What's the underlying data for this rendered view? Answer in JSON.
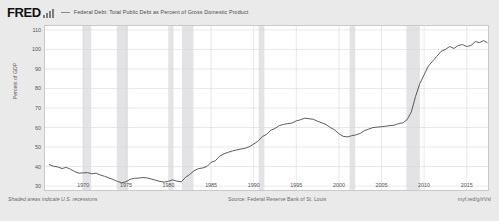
{
  "header": {
    "logo_text": "FRED",
    "logo_glyph_name": "bar-chart-glyph",
    "legend_marker_name": "legend-line-marker",
    "series_label": "Federal Debt: Total Public Debt as Percent of Gross Domestic Product"
  },
  "footer": {
    "recession_note": "Shaded areas indicate U.S. recessions",
    "source": "Source: Federal Reserve Bank of St. Louis",
    "url": "myf.red/g/irVsl"
  },
  "colors": {
    "line": "#4a4a4a",
    "recession_band": "#e3e3e6",
    "grid": "#d8d8d8",
    "plot_bg": "#ffffff",
    "page_bg": "#eaeaea",
    "frame": "#c9c9c9",
    "text": "#555555"
  },
  "chart_data": {
    "type": "line",
    "title": "Federal Debt: Total Public Debt as Percent of Gross Domestic Product",
    "xlabel": "",
    "ylabel": "Percent of GDP",
    "xlim": [
      1965.5,
      2017.5
    ],
    "ylim": [
      28,
      112
    ],
    "yticks": [
      110,
      100,
      90,
      80,
      70,
      60,
      50,
      40,
      30
    ],
    "xticks": [
      1970,
      1975,
      1980,
      1985,
      1990,
      1995,
      2000,
      2005,
      2010,
      2015
    ],
    "grid": true,
    "legend_position": "top",
    "series": [
      {
        "name": "Federal Debt: Total Public Debt as Percent of Gross Domestic Product",
        "x": [
          1966.0,
          1966.5,
          1967.0,
          1967.5,
          1968.0,
          1968.5,
          1969.0,
          1969.5,
          1970.0,
          1970.5,
          1971.0,
          1971.5,
          1972.0,
          1972.5,
          1973.0,
          1973.5,
          1974.0,
          1974.5,
          1975.0,
          1975.5,
          1976.0,
          1976.5,
          1977.0,
          1977.5,
          1978.0,
          1978.5,
          1979.0,
          1979.5,
          1980.0,
          1980.5,
          1981.0,
          1981.5,
          1982.0,
          1982.5,
          1983.0,
          1983.5,
          1984.0,
          1984.5,
          1985.0,
          1985.5,
          1986.0,
          1986.5,
          1987.0,
          1987.5,
          1988.0,
          1988.5,
          1989.0,
          1989.5,
          1990.0,
          1990.5,
          1991.0,
          1991.5,
          1992.0,
          1992.5,
          1993.0,
          1993.5,
          1994.0,
          1994.5,
          1995.0,
          1995.5,
          1996.0,
          1996.5,
          1997.0,
          1997.5,
          1998.0,
          1998.5,
          1999.0,
          1999.5,
          2000.0,
          2000.5,
          2001.0,
          2001.5,
          2002.0,
          2002.5,
          2003.0,
          2003.5,
          2004.0,
          2004.5,
          2005.0,
          2005.5,
          2006.0,
          2006.5,
          2007.0,
          2007.5,
          2008.0,
          2008.5,
          2009.0,
          2009.5,
          2010.0,
          2010.5,
          2011.0,
          2011.5,
          2012.0,
          2012.5,
          2013.0,
          2013.5,
          2014.0,
          2014.5,
          2015.0,
          2015.5,
          2016.0,
          2016.5,
          2017.0,
          2017.4
        ],
        "values": [
          41.0,
          40.2,
          39.8,
          39.0,
          39.6,
          38.6,
          37.4,
          36.6,
          36.8,
          36.9,
          36.3,
          36.6,
          35.7,
          35.0,
          34.2,
          33.4,
          32.4,
          31.7,
          32.2,
          33.5,
          34.0,
          34.1,
          34.4,
          34.2,
          33.6,
          33.0,
          32.4,
          32.0,
          32.5,
          33.2,
          32.5,
          32.2,
          34.5,
          36.0,
          37.9,
          38.9,
          39.3,
          40.0,
          42.2,
          43.0,
          45.3,
          46.5,
          47.3,
          48.0,
          48.5,
          49.0,
          49.4,
          50.2,
          51.5,
          53.0,
          55.3,
          56.5,
          58.6,
          59.5,
          61.0,
          61.6,
          62.0,
          62.3,
          63.4,
          64.0,
          64.8,
          64.5,
          64.2,
          63.2,
          62.4,
          61.5,
          60.0,
          58.8,
          56.8,
          55.5,
          55.2,
          55.8,
          56.2,
          57.0,
          58.4,
          59.2,
          60.0,
          60.2,
          60.4,
          60.7,
          61.0,
          61.2,
          62.0,
          62.4,
          64.0,
          68.0,
          76.0,
          82.5,
          87.0,
          91.5,
          94.0,
          96.5,
          99.0,
          100.0,
          101.5,
          100.5,
          102.0,
          102.5,
          101.5,
          102.0,
          104.0,
          103.5,
          104.5,
          103.5
        ],
        "color": "#4a4a4a",
        "linewidth": 0.9
      }
    ],
    "recession_bands": [
      {
        "start": 1969.92,
        "end": 1970.92
      },
      {
        "start": 1973.92,
        "end": 1975.25
      },
      {
        "start": 1980.08,
        "end": 1980.58
      },
      {
        "start": 1981.58,
        "end": 1982.92
      },
      {
        "start": 1990.58,
        "end": 1991.25
      },
      {
        "start": 2001.25,
        "end": 2001.92
      },
      {
        "start": 2007.92,
        "end": 2009.5
      }
    ]
  }
}
